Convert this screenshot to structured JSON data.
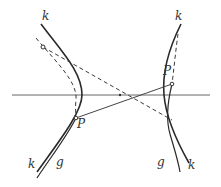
{
  "diagram": {
    "type": "hyperbola-construction",
    "colors": {
      "stroke": "#2a2a2a",
      "axis": "#555555",
      "dashed": "#3a3a3a",
      "label": "#333333"
    },
    "labels": {
      "k_top_left": "k",
      "k_top_right": "k",
      "k_bottom_left": "k",
      "k_bottom_right": "k",
      "g_bottom_left": "g",
      "g_bottom_right": "g",
      "P_left": "P",
      "P_right": "P"
    },
    "points": {
      "center": [
        120,
        95
      ],
      "P_left": [
        76,
        118
      ],
      "P_right": [
        172,
        84
      ],
      "circle_point": [
        43,
        47
      ]
    }
  }
}
